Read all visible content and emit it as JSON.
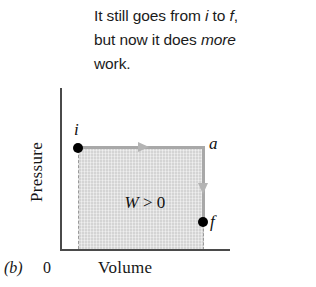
{
  "caption": {
    "line1_pre": "It still goes from ",
    "line1_i": "i",
    "line1_mid": " to ",
    "line1_f": "f",
    "line1_post": ",",
    "line2_pre": "but now it does ",
    "line2_em": "more",
    "line3": "work."
  },
  "figure": {
    "panel_label": "(b)",
    "origin_label": "0",
    "x_axis_label": "Volume",
    "y_axis_label": "Pressure",
    "work_label_symbol": "W",
    "work_label_rest": " > 0",
    "point_i_label": "i",
    "point_a_label": "a",
    "point_f_label": "f"
  },
  "colors": {
    "shaded_area": "#dcdcdc",
    "path_line": "#a8a8a8",
    "arrow": "#b4b4b4",
    "axis": "#4a4a4a",
    "point": "#000000",
    "text": "#161616",
    "dashed_guide": "#9a9a9a"
  },
  "chart_data": {
    "type": "line",
    "title": "",
    "xlabel": "Volume",
    "ylabel": "Pressure",
    "annotations": [
      "W > 0"
    ],
    "grid": false,
    "legend": "none",
    "points": [
      {
        "name": "i",
        "x": 0.14,
        "y": 0.64
      },
      {
        "name": "a",
        "x": 0.85,
        "y": 0.64
      },
      {
        "name": "f",
        "x": 0.85,
        "y": 0.19
      }
    ],
    "path": [
      "i",
      "a",
      "f"
    ],
    "path_directions": [
      "right",
      "down"
    ],
    "shaded_region": {
      "x_from": 0.14,
      "x_to": 0.85,
      "y_from": 0.0,
      "y_to": 0.64
    },
    "xlim": [
      0,
      1
    ],
    "ylim": [
      0,
      1
    ]
  }
}
